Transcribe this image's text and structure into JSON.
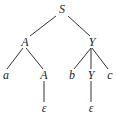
{
  "diagram": {
    "type": "parse-tree",
    "nodes": [
      {
        "id": "n0",
        "label": "S",
        "x": 62,
        "y": 13
      },
      {
        "id": "n1",
        "label": "A",
        "x": 25,
        "y": 46
      },
      {
        "id": "n2",
        "label": "Y",
        "x": 92,
        "y": 46
      },
      {
        "id": "n3",
        "label": "a",
        "x": 6,
        "y": 79
      },
      {
        "id": "n4",
        "label": "A",
        "x": 44,
        "y": 79
      },
      {
        "id": "n5",
        "label": "b",
        "x": 72,
        "y": 79
      },
      {
        "id": "n6",
        "label": "Y",
        "x": 91,
        "y": 79
      },
      {
        "id": "n7",
        "label": "c",
        "x": 110,
        "y": 79
      },
      {
        "id": "n8",
        "label": "ε",
        "x": 44,
        "y": 112
      },
      {
        "id": "n9",
        "label": "ε",
        "x": 91,
        "y": 112
      }
    ],
    "edges": [
      {
        "from": "n0",
        "to": "n1",
        "x1": 56,
        "y1": 16,
        "x2": 30,
        "y2": 36
      },
      {
        "from": "n0",
        "to": "n2",
        "x1": 68,
        "y1": 16,
        "x2": 90,
        "y2": 36
      },
      {
        "from": "n1",
        "to": "n3",
        "x1": 23,
        "y1": 48,
        "x2": 7,
        "y2": 69
      },
      {
        "from": "n1",
        "to": "n4",
        "x1": 26,
        "y1": 48,
        "x2": 43,
        "y2": 69
      },
      {
        "from": "n2",
        "to": "n5",
        "x1": 91,
        "y1": 48,
        "x2": 74,
        "y2": 69
      },
      {
        "from": "n2",
        "to": "n6",
        "x1": 91,
        "y1": 48,
        "x2": 91,
        "y2": 69
      },
      {
        "from": "n2",
        "to": "n7",
        "x1": 92,
        "y1": 48,
        "x2": 108,
        "y2": 69
      },
      {
        "from": "n4",
        "to": "n8",
        "x1": 44,
        "y1": 81,
        "x2": 44,
        "y2": 102
      },
      {
        "from": "n6",
        "to": "n9",
        "x1": 91,
        "y1": 81,
        "x2": 91,
        "y2": 102
      }
    ]
  }
}
